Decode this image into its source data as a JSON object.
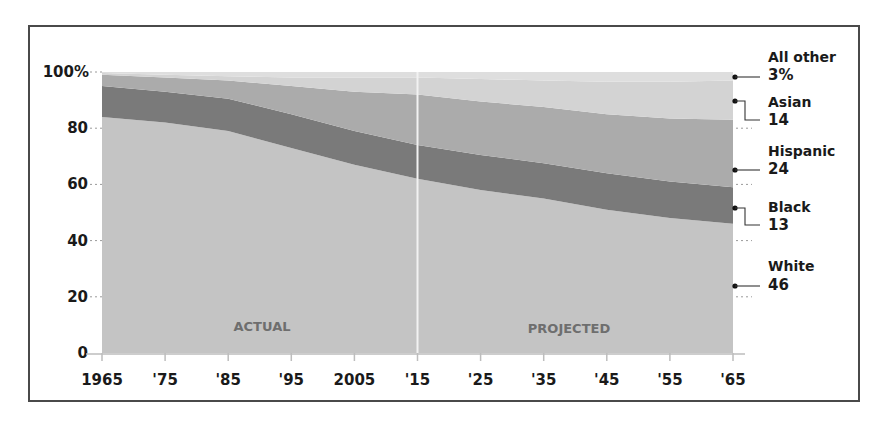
{
  "chart_data": {
    "type": "area",
    "stacked": true,
    "title": "",
    "xlabel": "",
    "ylabel": "",
    "ylim": [
      0,
      100
    ],
    "x": [
      1965,
      1975,
      1985,
      1995,
      2005,
      2015,
      2025,
      2035,
      2045,
      2055,
      2065
    ],
    "x_tick_labels": [
      "1965",
      "'75",
      "'85",
      "'95",
      "2005",
      "'15",
      "'25",
      "'35",
      "'45",
      "'55",
      "'65"
    ],
    "y_tick_labels": [
      "0",
      "20",
      "40",
      "60",
      "80",
      "100%"
    ],
    "y_ticks": [
      0,
      20,
      40,
      60,
      80,
      100
    ],
    "series": [
      {
        "name": "White",
        "color": "#c4c4c4",
        "values": [
          84,
          82,
          79,
          73,
          67,
          62,
          58,
          55,
          51,
          48,
          46
        ]
      },
      {
        "name": "Black",
        "color": "#7a7a7a",
        "values": [
          11,
          11,
          11.5,
          12,
          12,
          12,
          12.5,
          12.5,
          13,
          13,
          13
        ]
      },
      {
        "name": "Hispanic",
        "color": "#ababab",
        "values": [
          4,
          5,
          6.5,
          10,
          14,
          18,
          19,
          20,
          21,
          22.5,
          24
        ]
      },
      {
        "name": "Asian",
        "color": "#d3d3d3",
        "values": [
          0.6,
          1,
          1.5,
          3,
          5,
          6,
          8,
          9.5,
          11.5,
          13,
          14
        ]
      },
      {
        "name": "All other",
        "color": "#dedede",
        "values": [
          0.4,
          1,
          1.5,
          2,
          2,
          2,
          2.5,
          3,
          3.5,
          3.5,
          3
        ]
      }
    ],
    "annotations": [
      {
        "text": "ACTUAL",
        "x_range": [
          1965,
          2015
        ]
      },
      {
        "text": "PROJECTED",
        "x_range": [
          2015,
          2065
        ]
      }
    ],
    "divider_at": 2015,
    "legend_position": "right",
    "grid": false
  },
  "legend": [
    {
      "name": "All other",
      "value": "3%"
    },
    {
      "name": "Asian",
      "value": "14"
    },
    {
      "name": "Hispanic",
      "value": "24"
    },
    {
      "name": "Black",
      "value": "13"
    },
    {
      "name": "White",
      "value": "46"
    }
  ],
  "phases": {
    "actual": "ACTUAL",
    "projected": "PROJECTED"
  }
}
